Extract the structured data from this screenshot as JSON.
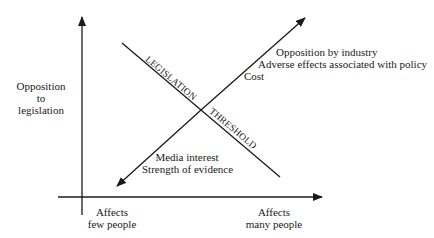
{
  "diagram": {
    "y_axis_label": [
      "Opposition",
      "to",
      "legislation"
    ],
    "x_axis_left_label": [
      "Affects",
      "few people"
    ],
    "x_axis_right_label": [
      "Affects",
      "many people"
    ],
    "threshold_line_labels": {
      "upper": "LEGISLATION",
      "lower": "THRESHOLD"
    },
    "upper_factors": [
      "Opposition by industry",
      "Adverse effects associated with policy",
      "Cost"
    ],
    "lower_factors": [
      "Media interest",
      "Strength of evidence"
    ],
    "colors": {
      "line": "#1a1a1a",
      "background": "#ffffff"
    }
  }
}
